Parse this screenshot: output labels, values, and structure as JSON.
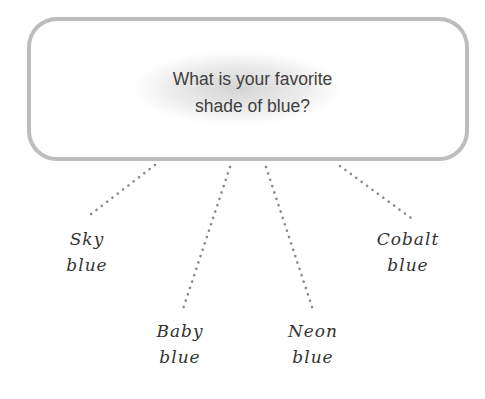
{
  "diagram": {
    "type": "question-with-answer-branches",
    "question": {
      "line1": "What is your favorite",
      "line2": "shade of blue?",
      "full_text": "What is your favorite shade of blue?"
    },
    "answers": [
      {
        "id": "sky",
        "line1": "Sky",
        "line2": "blue"
      },
      {
        "id": "baby",
        "line1": "Baby",
        "line2": "blue"
      },
      {
        "id": "neon",
        "line1": "Neon",
        "line2": "blue"
      },
      {
        "id": "cobalt",
        "line1": "Cobalt",
        "line2": "blue"
      }
    ],
    "connector_style": "dotted",
    "colors": {
      "box_border": "#bdbdbd",
      "connector": "#8a8a8a",
      "question_text": "#3f3f3f",
      "label_text": "#333333"
    }
  }
}
